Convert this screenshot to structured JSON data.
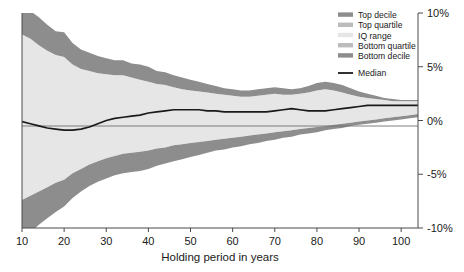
{
  "chart_data": {
    "type": "area",
    "title": "",
    "xlabel": "Holding period in years",
    "ylabel": "",
    "xlim": [
      10,
      104
    ],
    "ylim": [
      -10,
      10
    ],
    "grid": false,
    "zero_line": true,
    "legend_position": "top-right",
    "x_ticks": [
      "10",
      "20",
      "30",
      "40",
      "50",
      "60",
      "70",
      "80",
      "90",
      "100"
    ],
    "x_tick_values": [
      10,
      20,
      30,
      40,
      50,
      60,
      70,
      80,
      90,
      100
    ],
    "y_ticks": [
      "10%",
      "5%",
      "0%",
      "-5%",
      "-10%"
    ],
    "y_tick_values": [
      10,
      5,
      0,
      -5,
      -10
    ],
    "legend": [
      {
        "label": "Top decile",
        "color": "#8d8d8d",
        "type": "band"
      },
      {
        "label": "Top quartile",
        "color": "#bcbcbc",
        "type": "band"
      },
      {
        "label": "IQ range",
        "color": "#e6e6e6",
        "type": "band"
      },
      {
        "label": "Bottom quartile",
        "color": "#bcbcbc",
        "type": "band"
      },
      {
        "label": "Bottom decile",
        "color": "#8d8d8d",
        "type": "band"
      },
      {
        "label": "Median",
        "color": "#1a1a1a",
        "type": "line"
      }
    ],
    "x": [
      10,
      12,
      14,
      16,
      18,
      20,
      22,
      24,
      26,
      28,
      30,
      32,
      34,
      36,
      38,
      40,
      42,
      44,
      46,
      48,
      50,
      52,
      54,
      56,
      58,
      60,
      62,
      64,
      66,
      68,
      70,
      72,
      74,
      76,
      78,
      80,
      82,
      84,
      86,
      88,
      90,
      92,
      94,
      96,
      98,
      100,
      102,
      104
    ],
    "series": [
      {
        "name": "Top decile",
        "values": [
          10.6,
          10.2,
          9.6,
          8.9,
          8.3,
          8.2,
          7.2,
          6.6,
          6.3,
          6.0,
          5.8,
          5.6,
          5.6,
          5.3,
          5.2,
          5.0,
          4.6,
          4.5,
          4.2,
          4.0,
          3.8,
          3.6,
          3.4,
          3.2,
          3.0,
          2.9,
          2.8,
          2.8,
          2.9,
          3.0,
          3.1,
          3.0,
          2.9,
          3.0,
          3.2,
          3.5,
          3.6,
          3.5,
          3.3,
          3.0,
          2.7,
          2.5,
          2.3,
          2.1,
          2.0,
          1.9,
          1.9,
          1.9
        ]
      },
      {
        "name": "Top quartile",
        "values": [
          8.0,
          7.6,
          7.0,
          6.5,
          6.1,
          5.9,
          5.2,
          4.8,
          4.6,
          4.4,
          4.3,
          4.2,
          4.2,
          4.0,
          3.8,
          3.6,
          3.4,
          3.3,
          3.1,
          2.9,
          2.8,
          2.7,
          2.6,
          2.5,
          2.4,
          2.3,
          2.2,
          2.2,
          2.3,
          2.4,
          2.5,
          2.4,
          2.4,
          2.5,
          2.6,
          2.8,
          2.9,
          2.8,
          2.6,
          2.4,
          2.2,
          2.1,
          2.0,
          1.9,
          1.8,
          1.8,
          1.8,
          1.8
        ]
      },
      {
        "name": "Median",
        "values": [
          -0.1,
          -0.3,
          -0.5,
          -0.7,
          -0.8,
          -0.9,
          -0.9,
          -0.8,
          -0.6,
          -0.3,
          0.0,
          0.2,
          0.3,
          0.4,
          0.5,
          0.7,
          0.8,
          0.9,
          1.0,
          1.0,
          1.0,
          1.0,
          0.9,
          0.9,
          0.8,
          0.8,
          0.8,
          0.8,
          0.8,
          0.8,
          0.9,
          1.0,
          1.1,
          1.0,
          0.9,
          0.9,
          0.9,
          1.0,
          1.1,
          1.2,
          1.3,
          1.4,
          1.4,
          1.4,
          1.4,
          1.4,
          1.4,
          1.4
        ]
      },
      {
        "name": "Bottom quartile",
        "values": [
          -7.4,
          -7.0,
          -6.6,
          -6.2,
          -5.8,
          -5.5,
          -4.9,
          -4.5,
          -4.1,
          -3.8,
          -3.5,
          -3.3,
          -3.1,
          -3.0,
          -2.9,
          -2.8,
          -2.6,
          -2.5,
          -2.3,
          -2.2,
          -2.1,
          -2.0,
          -1.9,
          -1.8,
          -1.7,
          -1.6,
          -1.5,
          -1.4,
          -1.3,
          -1.2,
          -1.1,
          -1.0,
          -0.9,
          -0.8,
          -0.7,
          -0.6,
          -0.5,
          -0.4,
          -0.3,
          -0.2,
          -0.1,
          0.0,
          0.1,
          0.2,
          0.3,
          0.4,
          0.5,
          0.6
        ]
      },
      {
        "name": "Bottom decile",
        "values": [
          -11.0,
          -10.4,
          -9.7,
          -9.1,
          -8.5,
          -8.0,
          -7.2,
          -6.6,
          -6.1,
          -5.7,
          -5.4,
          -5.1,
          -4.9,
          -4.8,
          -4.7,
          -4.5,
          -4.2,
          -4.0,
          -3.8,
          -3.6,
          -3.4,
          -3.2,
          -3.0,
          -2.8,
          -2.7,
          -2.5,
          -2.4,
          -2.2,
          -2.1,
          -1.9,
          -1.8,
          -1.6,
          -1.5,
          -1.3,
          -1.2,
          -1.1,
          -0.9,
          -0.8,
          -0.7,
          -0.5,
          -0.4,
          -0.3,
          -0.2,
          -0.1,
          0.0,
          0.1,
          0.2,
          0.3
        ]
      }
    ]
  }
}
